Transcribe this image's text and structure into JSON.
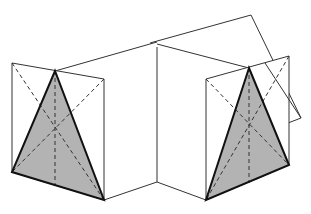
{
  "figure": {
    "colors": {
      "background": "#ffffff",
      "line": "#333333",
      "shade": "#b3b3b3",
      "edge": "#111111"
    },
    "left_prism": {
      "frame": [
        [
          12,
          63
        ],
        [
          104,
          79
        ],
        [
          104,
          200
        ],
        [
          12,
          172
        ]
      ],
      "triangle": [
        [
          55,
          71
        ],
        [
          12,
          172
        ],
        [
          104,
          200
        ]
      ],
      "dashed": [
        [
          [
            55,
            71
          ],
          [
            55,
            185
          ]
        ],
        [
          [
            12,
            63
          ],
          [
            104,
            200
          ]
        ],
        [
          [
            104,
            79
          ],
          [
            12,
            172
          ]
        ]
      ]
    },
    "right_prism": {
      "frame": [
        [
          206,
          79
        ],
        [
          289,
          56
        ],
        [
          289,
          165
        ],
        [
          206,
          200
        ]
      ],
      "triangle": [
        [
          249,
          68
        ],
        [
          206,
          200
        ],
        [
          289,
          165
        ]
      ],
      "dashed": [
        [
          [
            249,
            68
          ],
          [
            249,
            183
          ]
        ],
        [
          [
            206,
            79
          ],
          [
            289,
            165
          ]
        ],
        [
          [
            289,
            56
          ],
          [
            206,
            200
          ]
        ]
      ]
    },
    "connectors": {
      "top_left": [
        [
          55,
          71
        ],
        [
          157,
          42
        ]
      ],
      "bottom_left": [
        [
          104,
          200
        ],
        [
          157,
          182
        ]
      ],
      "center_vertical": [
        [
          157,
          47
        ],
        [
          157,
          182
        ]
      ],
      "bottom_right": [
        [
          157,
          182
        ],
        [
          206,
          200
        ]
      ],
      "top_mid": [
        [
          157,
          42
        ],
        [
          249,
          68
        ]
      ]
    },
    "tilted_plane": [
      [
        150,
        43
      ],
      [
        251,
        15
      ],
      [
        301,
        118
      ],
      [
        275,
        128
      ]
    ]
  }
}
